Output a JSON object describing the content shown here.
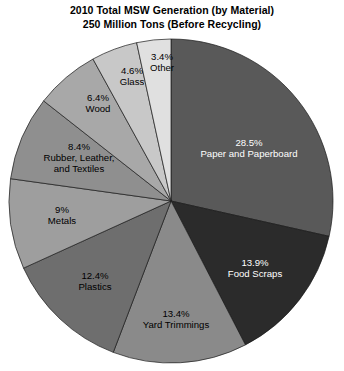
{
  "chart_title": {
    "line1": "2010 Total MSW Generation (by Material)",
    "line2": "250 Million Tons (Before Recycling)"
  },
  "chart_data": {
    "type": "pie",
    "title": "2010 Total MSW Generation (by Material) 250 Million Tons (Before Recycling)",
    "xlabel": "",
    "ylabel": "",
    "units": "percent of total",
    "total_label": "250 Million Tons",
    "start_angle_deg": 0,
    "direction": "clockwise",
    "legend": "none (labels drawn inside slices)",
    "grid": false,
    "categories": [
      "Paper and Paperboard",
      "Food Scraps",
      "Yard Trimmings",
      "Plastics",
      "Metals",
      "Rubber, Leather, and Textiles",
      "Wood",
      "Glass",
      "Other"
    ],
    "values": [
      28.5,
      13.9,
      13.4,
      12.4,
      9.0,
      8.4,
      6.4,
      4.6,
      3.4
    ],
    "slices": [
      {
        "name": "Paper and Paperboard",
        "percent": 28.5,
        "percent_label": "28.5%",
        "name_line1": "Paper and Paperboard",
        "name_line2": "",
        "color": "#595959",
        "text_color": "#ffffff"
      },
      {
        "name": "Food Scraps",
        "percent": 13.9,
        "percent_label": "13.9%",
        "name_line1": "Food Scraps",
        "name_line2": "",
        "color": "#2b2b2b",
        "text_color": "#ffffff"
      },
      {
        "name": "Yard Trimmings",
        "percent": 13.4,
        "percent_label": "13.4%",
        "name_line1": "Yard Trimmings",
        "name_line2": "",
        "color": "#8a8a8a",
        "text_color": "#000000"
      },
      {
        "name": "Plastics",
        "percent": 12.4,
        "percent_label": "12.4%",
        "name_line1": "Plastics",
        "name_line2": "",
        "color": "#6e6e6e",
        "text_color": "#000000"
      },
      {
        "name": "Metals",
        "percent": 9.0,
        "percent_label": "9%",
        "name_line1": "Metals",
        "name_line2": "",
        "color": "#9e9e9e",
        "text_color": "#000000"
      },
      {
        "name": "Rubber, Leather, and Textiles",
        "percent": 8.4,
        "percent_label": "8.4%",
        "name_line1": "Rubber, Leather,",
        "name_line2": "and Textiles",
        "color": "#8f8f8f",
        "text_color": "#000000"
      },
      {
        "name": "Wood",
        "percent": 6.4,
        "percent_label": "6.4%",
        "name_line1": "Wood",
        "name_line2": "",
        "color": "#a8a8a8",
        "text_color": "#000000"
      },
      {
        "name": "Glass",
        "percent": 4.6,
        "percent_label": "4.6%",
        "name_line1": "Glass",
        "name_line2": "",
        "color": "#c8c8c8",
        "text_color": "#000000"
      },
      {
        "name": "Other",
        "percent": 3.4,
        "percent_label": "3.4%",
        "name_line1": "Other",
        "name_line2": "",
        "color": "#e0e0e0",
        "text_color": "#000000"
      }
    ],
    "geometry": {
      "center_x": 171,
      "center_y": 201,
      "radius": 162,
      "outline_color": "#1a1a1a"
    },
    "label_positions": [
      {
        "name": "Paper and Paperboard",
        "x": 249,
        "y": 148
      },
      {
        "name": "Food Scraps",
        "x": 255,
        "y": 268
      },
      {
        "name": "Yard Trimmings",
        "x": 176,
        "y": 319
      },
      {
        "name": "Plastics",
        "x": 95,
        "y": 281
      },
      {
        "name": "Metals",
        "x": 62,
        "y": 215
      },
      {
        "name": "Rubber, Leather, and Textiles",
        "x": 79,
        "y": 158
      },
      {
        "name": "Wood",
        "x": 98,
        "y": 103
      },
      {
        "name": "Glass",
        "x": 132,
        "y": 76
      },
      {
        "name": "Other",
        "x": 162,
        "y": 62
      }
    ]
  }
}
